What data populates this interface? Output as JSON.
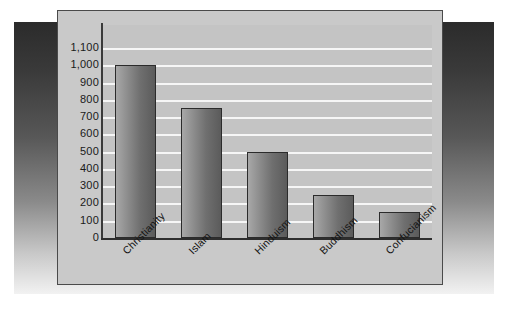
{
  "chart_data": {
    "type": "bar",
    "title": "",
    "subtitle": "",
    "xlabel": "",
    "ylabel": "",
    "categories": [
      "Christianity",
      "Islam",
      "Hinduism",
      "Buddhism",
      "Confucianism"
    ],
    "values": [
      1000,
      750,
      500,
      250,
      150
    ],
    "ylim": [
      0,
      1100
    ],
    "ytick_labels": [
      "1,100",
      "1,000",
      "900",
      "800",
      "700",
      "600",
      "500",
      "400",
      "300",
      "200",
      "100",
      "0"
    ],
    "ytick_values": [
      1100,
      1000,
      900,
      800,
      700,
      600,
      500,
      400,
      300,
      200,
      100,
      0
    ],
    "grid": true,
    "grid_axis": "y",
    "legend": false,
    "series": [
      {
        "name": "",
        "values": [
          1000,
          750,
          500,
          250,
          150
        ]
      }
    ]
  },
  "colors": {
    "panel_background": "#c9c9c9",
    "plot_background": "#c4c4c4",
    "gridline": "#f6f6f6",
    "bar_light": "#a8a8a8",
    "bar_dark": "#5b5b5b",
    "bar_outline": "#2b2b2b",
    "axis": "#2e2e2e",
    "text": "#1a1a1a",
    "page_background": "#ffffff"
  }
}
